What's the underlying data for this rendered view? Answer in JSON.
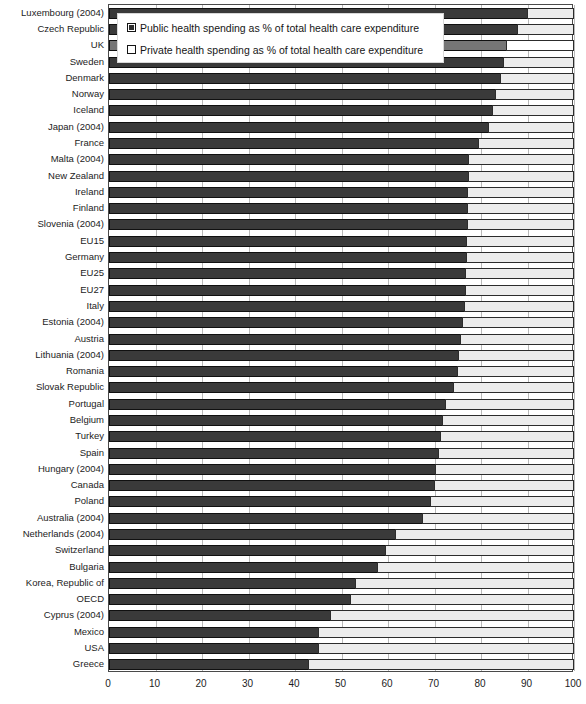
{
  "chart_data": {
    "type": "bar",
    "orientation": "horizontal",
    "stacked": true,
    "title": "",
    "subtitle": "",
    "xlabel": "",
    "ylabel": "",
    "xlim": [
      0,
      100
    ],
    "xticks": [
      0,
      10,
      20,
      30,
      40,
      50,
      60,
      70,
      80,
      90,
      100
    ],
    "xtick_labels": [
      "0",
      "10",
      "20",
      "30",
      "40",
      "50",
      "60",
      "70",
      "80",
      "90",
      "100"
    ],
    "grid": true,
    "grid_axis": "x",
    "legend_position": "top-left-inset",
    "legend": [
      "Public health spending as % of total health care expenditure",
      "Private health spending as % of total health care expenditure"
    ],
    "series": [
      {
        "name": "Public health spending as % of total health care expenditure",
        "color": "#3a3a3a",
        "values": [
          90.0,
          88.0,
          85.5,
          84.9,
          84.3,
          83.2,
          82.6,
          81.7,
          79.6,
          77.5,
          77.4,
          77.3,
          77.2,
          77.1,
          77.0,
          76.9,
          76.8,
          76.7,
          76.5,
          76.2,
          75.7,
          75.3,
          75.1,
          74.2,
          72.5,
          71.8,
          71.4,
          71.0,
          70.4,
          70.2,
          69.3,
          67.5,
          61.7,
          59.6,
          57.8,
          53.1,
          52.0,
          47.7,
          45.2,
          45.2,
          43.0
        ]
      },
      {
        "name": "Private health spending as % of total health care expenditure",
        "color": "#ececec",
        "values": [
          10.0,
          12.0,
          14.5,
          15.1,
          15.7,
          16.8,
          17.4,
          18.3,
          20.4,
          22.5,
          22.6,
          22.7,
          22.8,
          22.9,
          23.0,
          23.1,
          23.2,
          23.3,
          23.5,
          23.8,
          24.3,
          24.7,
          24.9,
          25.8,
          27.5,
          28.2,
          28.6,
          29.0,
          29.6,
          29.8,
          30.7,
          32.5,
          38.3,
          40.4,
          42.2,
          46.9,
          48.0,
          52.3,
          54.8,
          54.8,
          57.0
        ]
      }
    ],
    "categories": [
      "Luxembourg (2004)",
      "Czech Republic",
      "UK",
      "Sweden",
      "Denmark",
      "Norway",
      "Iceland",
      "Japan (2004)",
      "France",
      "Malta (2004)",
      "New Zealand",
      "Ireland",
      "Finland",
      "Slovenia (2004)",
      "EU15",
      "Germany",
      "EU25",
      "EU27",
      "Italy",
      "Estonia (2004)",
      "Austria",
      "Lithuania (2004)",
      "Romania",
      "Slovak Republic",
      "Portugal",
      "Belgium",
      "Turkey",
      "Spain",
      "Hungary (2004)",
      "Canada",
      "Poland",
      "Australia (2004)",
      "Netherlands (2004)",
      "Switzerland",
      "Bulgaria",
      "Korea, Republic of",
      "OECD",
      "Cyprus (2004)",
      "Mexico",
      "USA",
      "Greece"
    ],
    "highlighted_categories": [
      "UK"
    ],
    "colors": {
      "public": "#3a3a3a",
      "public_highlight": "#767676",
      "private": "#ececec",
      "private_highlight": "#ffffff",
      "grid": "#b9b9b9",
      "axis": "#4a4a4a",
      "text": "#1c1c1c"
    }
  }
}
